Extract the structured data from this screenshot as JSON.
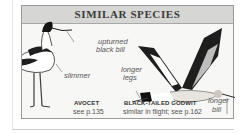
{
  "panel": {
    "title": "SIMILAR SPECIES"
  },
  "labels": {
    "upturned": "upturned",
    "black_bill": "black bill",
    "slimmer": "slimmer",
    "longer_legs_1": "longer",
    "longer_legs_2": "legs",
    "longer_bill_1": "longer",
    "longer_bill_2": "bill"
  },
  "species": [
    {
      "name": "AVOCET",
      "ref": "see p.135"
    },
    {
      "name": "BLACK-TAILED GODWIT",
      "ref": "similar in flight; see p.162"
    }
  ],
  "colors": {
    "header_bg": "#d6d6d4",
    "panel_bg": "#f7f7f5",
    "border": "#9a9a9a"
  }
}
